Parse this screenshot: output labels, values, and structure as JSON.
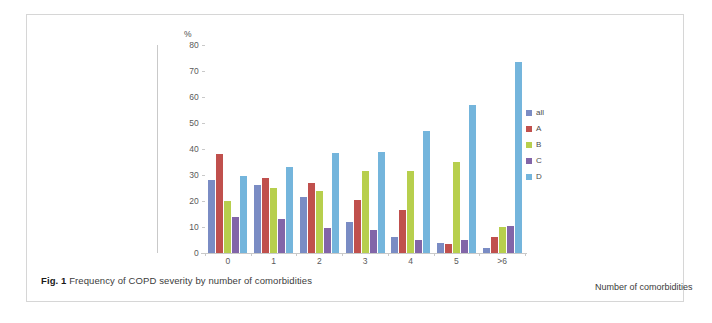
{
  "figure": {
    "caption_prefix": "Fig. 1",
    "caption_text": "Frequency of COPD severity by number of comorbidities"
  },
  "chart_data": {
    "type": "bar",
    "title": "",
    "subtitle": "",
    "xlabel": "Number of comorbidities",
    "ylabel": "%",
    "ylim": [
      0,
      80
    ],
    "yticks": [
      0,
      10,
      20,
      30,
      40,
      50,
      60,
      70,
      80
    ],
    "grid": false,
    "legend_position": "right",
    "categories": [
      "0",
      "1",
      "2",
      "3",
      "4",
      "5",
      ">6"
    ],
    "series": [
      {
        "name": "all",
        "color": "#7a8cc4",
        "values": [
          28,
          26,
          21.5,
          12,
          6,
          4,
          2
        ]
      },
      {
        "name": "A",
        "color": "#c0504d",
        "values": [
          38,
          29,
          27,
          20.5,
          16.5,
          3.5,
          6
        ]
      },
      {
        "name": "B",
        "color": "#b7cf4d",
        "values": [
          20,
          25,
          24,
          31.5,
          31.5,
          35,
          10
        ]
      },
      {
        "name": "C",
        "color": "#8265a8",
        "values": [
          14,
          13,
          9.5,
          9,
          5,
          5,
          10.5
        ]
      },
      {
        "name": "D",
        "color": "#74b5dc",
        "values": [
          29.5,
          33,
          38.5,
          39,
          47,
          57,
          73.5
        ]
      }
    ]
  },
  "legend": {
    "items": [
      {
        "label": "all",
        "color": "#7a8cc4"
      },
      {
        "label": "A",
        "color": "#c0504d"
      },
      {
        "label": "B",
        "color": "#b7cf4d"
      },
      {
        "label": "C",
        "color": "#8265a8"
      },
      {
        "label": "D",
        "color": "#74b5dc"
      }
    ]
  }
}
